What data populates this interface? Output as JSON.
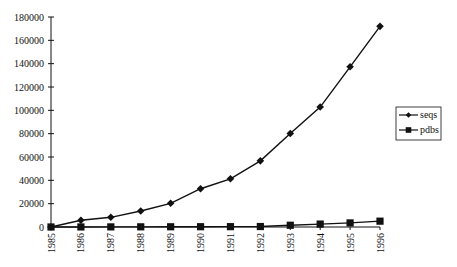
{
  "chart_data": {
    "type": "line",
    "title": "",
    "xlabel": "",
    "ylabel": "",
    "x": [
      "1985",
      "1986",
      "1987",
      "1988",
      "1989",
      "1990",
      "1991",
      "1992",
      "1993",
      "1994",
      "1995",
      "1996"
    ],
    "series": [
      {
        "name": "seqs",
        "marker": "diamond",
        "values": [
          0,
          5800,
          8300,
          13700,
          20300,
          32800,
          41300,
          56700,
          80100,
          102800,
          137300,
          172000
        ]
      },
      {
        "name": "pdbs",
        "marker": "square",
        "values": [
          0,
          50,
          100,
          150,
          200,
          250,
          300,
          400,
          1500,
          2500,
          3500,
          5000
        ]
      }
    ],
    "ylim": [
      0,
      180000
    ],
    "yticks": [
      0,
      20000,
      40000,
      60000,
      80000,
      100000,
      120000,
      140000,
      160000,
      180000
    ],
    "grid": false,
    "legend_position": "right"
  },
  "colors": {
    "line": "#111111",
    "background": "#ffffff"
  }
}
